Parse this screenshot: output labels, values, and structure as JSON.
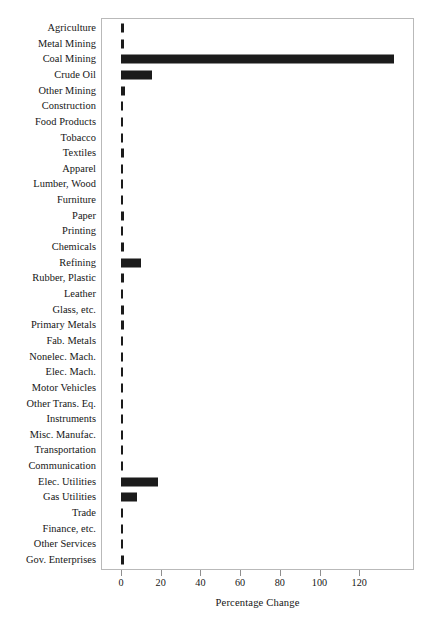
{
  "chart_data": {
    "type": "bar",
    "orientation": "horizontal",
    "title": "",
    "xlabel": "Percentage Change",
    "ylabel": "",
    "xlim": [
      -1.2,
      156
    ],
    "xticks": [
      0,
      20,
      40,
      60,
      80,
      100,
      120
    ],
    "xtick_labels": [
      "0",
      "20",
      "40",
      "60",
      "80",
      "100",
      "120"
    ],
    "grid": false,
    "legend": null,
    "bar_color": "#1b1b1b",
    "categories": [
      "Agriculture",
      "Metal Mining",
      "Coal Mining",
      "Crude Oil",
      "Other Mining",
      "Construction",
      "Food Products",
      "Tobacco",
      "Textiles",
      "Apparel",
      "Lumber, Wood",
      "Furniture",
      "Paper",
      "Printing",
      "Chemicals",
      "Refining",
      "Rubber, Plastic",
      "Leather",
      "Glass, etc.",
      "Primary Metals",
      "Fab. Metals",
      "Nonelec. Mach.",
      "Elec. Mach.",
      "Motor Vehicles",
      "Other Trans. Eq.",
      "Instruments",
      "Misc. Manufac.",
      "Transportation",
      "Communication",
      "Elec. Utilities",
      "Gas Utilities",
      "Trade",
      "Finance, etc.",
      "Other Services",
      "Gov. Enterprises"
    ],
    "values": [
      1.7,
      1.7,
      137.4,
      15.8,
      1.8,
      0.9,
      0.9,
      0.8,
      1.5,
      0.7,
      0.8,
      0.8,
      1.4,
      0.7,
      1.5,
      10.3,
      1.4,
      0.5,
      1.6,
      1.6,
      1.0,
      0.8,
      0.7,
      0.6,
      0.6,
      0.6,
      0.7,
      1.1,
      1.0,
      18.7,
      7.9,
      0.8,
      0.8,
      0.9,
      1.3
    ]
  },
  "axis": {
    "x_title": "Percentage Change"
  }
}
